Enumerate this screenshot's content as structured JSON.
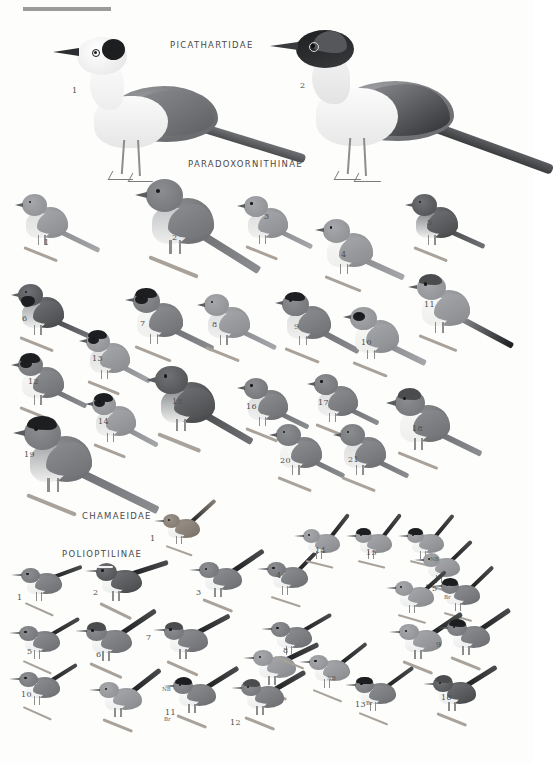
{
  "plate": {
    "background_color": "#fdfdfc",
    "ink_color": "#4a4a4a",
    "width": 533,
    "height": 763,
    "top_rule": {
      "color": "#9b9b9b",
      "x": 23,
      "y": 7,
      "width": 88,
      "height": 4
    }
  },
  "sections": [
    {
      "id": "picathartidae",
      "label": "PICATHARTIDAE",
      "x": 170,
      "y": 40
    },
    {
      "id": "paradoxornithinae",
      "label": "PARADOXORNITHINAE",
      "x": 188,
      "y": 159
    },
    {
      "id": "chamaeidae",
      "label": "CHAMAEIDAE",
      "x": 82,
      "y": 511
    },
    {
      "id": "polioptilinae",
      "label": "POLIOPTILINAE",
      "x": 62,
      "y": 549
    }
  ],
  "palette": {
    "dark": "#4b4c4e",
    "mid_dark": "#6f7174",
    "mid": "#8b8d90",
    "mid_light": "#a5a7aa",
    "light": "#c3c5c7",
    "pale": "#dedfe0",
    "white": "#f6f6f5",
    "black": "#1d1e20",
    "warm": "#9a9187",
    "bill": "#5c5d60",
    "leg": "#8d8d8d"
  },
  "plumage_codes": {
    "NB": "NB",
    "Br": "Br"
  },
  "figures": {
    "picathartidae": [
      {
        "num": "1",
        "label_x": 72,
        "label_y": 86
      },
      {
        "num": "2",
        "label_x": 300,
        "label_y": 81
      }
    ],
    "paradoxornithinae": [
      {
        "num": "1",
        "label_x": 44,
        "label_y": 238
      },
      {
        "num": "2",
        "label_x": 172,
        "label_y": 233
      },
      {
        "num": "3",
        "label_x": 264,
        "label_y": 212
      },
      {
        "num": "4",
        "label_x": 341,
        "label_y": 250
      },
      {
        "num": "5",
        "label_x": 427,
        "label_y": 218
      },
      {
        "num": "6",
        "label_x": 22,
        "label_y": 314
      },
      {
        "num": "7",
        "label_x": 140,
        "label_y": 319
      },
      {
        "num": "8",
        "label_x": 212,
        "label_y": 320
      },
      {
        "num": "9",
        "label_x": 294,
        "label_y": 322
      },
      {
        "num": "10",
        "label_x": 361,
        "label_y": 338
      },
      {
        "num": "11",
        "label_x": 424,
        "label_y": 300
      },
      {
        "num": "12",
        "label_x": 28,
        "label_y": 377
      },
      {
        "num": "13",
        "label_x": 92,
        "label_y": 354
      },
      {
        "num": "14",
        "label_x": 98,
        "label_y": 417
      },
      {
        "num": "15",
        "label_x": 172,
        "label_y": 397
      },
      {
        "num": "16",
        "label_x": 246,
        "label_y": 402
      },
      {
        "num": "17",
        "label_x": 318,
        "label_y": 398
      },
      {
        "num": "18",
        "label_x": 412,
        "label_y": 424
      },
      {
        "num": "19",
        "label_x": 24,
        "label_y": 450
      },
      {
        "num": "20",
        "label_x": 280,
        "label_y": 456
      },
      {
        "num": "21",
        "label_x": 348,
        "label_y": 455
      }
    ],
    "chamaeidae": [
      {
        "num": "1",
        "label_x": 150,
        "label_y": 534
      }
    ],
    "polioptilinae": [
      {
        "num": "1",
        "label_x": 17,
        "label_y": 593
      },
      {
        "num": "2",
        "label_x": 93,
        "label_y": 588
      },
      {
        "num": "3",
        "label_x": 196,
        "label_y": 588
      },
      {
        "num": "4",
        "label_x": 276,
        "label_y": 571
      },
      {
        "num": "5",
        "label_x": 27,
        "label_y": 647
      },
      {
        "num": "6",
        "label_x": 96,
        "label_y": 650
      },
      {
        "num": "7",
        "label_x": 146,
        "label_y": 633
      },
      {
        "num": "8",
        "label_x": 283,
        "label_y": 646
      },
      {
        "num": "9",
        "label_x": 436,
        "label_y": 640
      },
      {
        "num": "10",
        "label_x": 21,
        "label_y": 690
      },
      {
        "num": "11",
        "label_x": 165,
        "label_y": 708
      },
      {
        "num": "12",
        "label_x": 230,
        "label_y": 718
      },
      {
        "num": "13",
        "label_x": 355,
        "label_y": 700
      },
      {
        "num": "14",
        "label_x": 315,
        "label_y": 546
      },
      {
        "num": "15",
        "label_x": 366,
        "label_y": 548
      },
      {
        "num": "16",
        "label_x": 441,
        "label_y": 693
      },
      {
        "num": "5b",
        "label_x": 432,
        "label_y": 584
      }
    ],
    "plumage_marks": [
      {
        "code": "NB",
        "x": 430,
        "y": 556
      },
      {
        "code": "Br",
        "x": 444,
        "y": 594
      },
      {
        "code": "NB",
        "x": 162,
        "y": 686
      },
      {
        "code": "Br",
        "x": 164,
        "y": 716
      },
      {
        "code": "NB",
        "x": 327,
        "y": 675
      },
      {
        "code": "Br",
        "x": 366,
        "y": 700
      }
    ]
  }
}
